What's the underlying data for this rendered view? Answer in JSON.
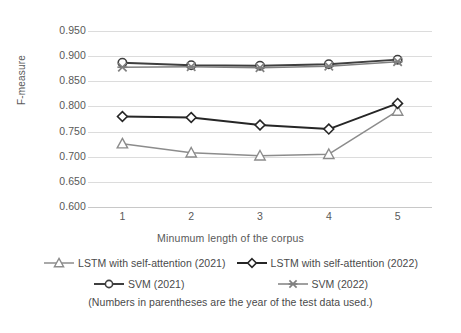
{
  "chart_data": {
    "type": "line",
    "title": "",
    "xlabel": "Minumum length of the corpus",
    "ylabel": "F-measure",
    "x": [
      1,
      2,
      3,
      4,
      5
    ],
    "categories": [
      "1",
      "2",
      "3",
      "4",
      "5"
    ],
    "xtick_labels": [
      "1",
      "2",
      "3",
      "4",
      "5"
    ],
    "ytick_labels": [
      "0.950",
      "0.900",
      "0.850",
      "0.800",
      "0.750",
      "0.700",
      "0.650",
      "0.600"
    ],
    "ytick_values": [
      0.95,
      0.9,
      0.85,
      0.8,
      0.75,
      0.7,
      0.65,
      0.6
    ],
    "ylim": [
      0.6,
      0.95
    ],
    "xlim": [
      1,
      5
    ],
    "grid": true,
    "legend_position": "bottom",
    "series": [
      {
        "name": "LSTM with self-attention (2021)",
        "marker": "triangle",
        "color": "#8c8c8c",
        "values": [
          0.726,
          0.708,
          0.702,
          0.705,
          0.791
        ]
      },
      {
        "name": "LSTM with self-attention (2022)",
        "marker": "diamond",
        "color": "#262626",
        "values": [
          0.78,
          0.778,
          0.763,
          0.755,
          0.806
        ]
      },
      {
        "name": "SVM (2021)",
        "marker": "circle",
        "color": "#3f3f3f",
        "values": [
          0.887,
          0.882,
          0.881,
          0.884,
          0.893
        ]
      },
      {
        "name": "SVM (2022)",
        "marker": "cross",
        "color": "#808080",
        "values": [
          0.878,
          0.879,
          0.877,
          0.88,
          0.889
        ]
      }
    ],
    "annotations": [
      "(Numbers in parentheses are the year of the test data used.)"
    ]
  },
  "axis": {
    "y_label": "F-measure",
    "x_label": "Minumum length of the corpus",
    "y_ticks": [
      "0.950",
      "0.900",
      "0.850",
      "0.800",
      "0.750",
      "0.700",
      "0.650",
      "0.600"
    ],
    "x_ticks": [
      "1",
      "2",
      "3",
      "4",
      "5"
    ]
  },
  "legend": {
    "row1": [
      {
        "label": "LSTM with self-attention (2021)",
        "marker": "triangle",
        "color": "#8c8c8c"
      },
      {
        "label": "LSTM with self-attention (2022)",
        "marker": "diamond",
        "color": "#262626"
      }
    ],
    "row2": [
      {
        "label": "SVM (2021)",
        "marker": "circle",
        "color": "#3f3f3f"
      },
      {
        "label": "SVM (2022)",
        "marker": "cross",
        "color": "#808080"
      }
    ]
  },
  "caption": "(Numbers in parentheses are the year of the test data used.)",
  "colors": {
    "grid": "#dcdcdc",
    "axis": "#c8c8c8",
    "text": "#595959",
    "series_lstm_2021": "#8c8c8c",
    "series_lstm_2022": "#262626",
    "series_svm_2021": "#3f3f3f",
    "series_svm_2022": "#808080"
  }
}
